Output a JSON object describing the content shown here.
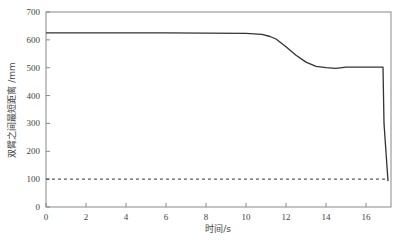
{
  "chart_data": {
    "type": "line",
    "title": "",
    "xlabel": "时间/s",
    "ylabel": "双臂之间最短距离 /mm",
    "xlim": [
      0,
      17.2
    ],
    "ylim": [
      0,
      700
    ],
    "x_ticks": [
      0,
      2,
      4,
      6,
      8,
      10,
      12,
      14,
      16
    ],
    "y_ticks": [
      0,
      100,
      200,
      300,
      400,
      500,
      600,
      700
    ],
    "grid": false,
    "legend": null,
    "series": [
      {
        "name": "双臂之间最短距离",
        "style": "solid",
        "color": "#333333",
        "x": [
          0,
          2,
          4,
          6,
          8,
          10,
          10.8,
          11.2,
          11.5,
          12,
          12.5,
          13,
          13.5,
          14,
          14.5,
          15,
          16,
          16.85,
          16.9,
          17.1
        ],
        "y": [
          625,
          625,
          625,
          625,
          624,
          623,
          620,
          612,
          603,
          575,
          545,
          520,
          505,
          500,
          498,
          502,
          502,
          502,
          300,
          93
        ]
      },
      {
        "name": "安全距离阈值",
        "style": "dashed",
        "color": "#333333",
        "x": [
          0,
          17.1
        ],
        "y": [
          100,
          100
        ]
      }
    ]
  },
  "caption": ""
}
